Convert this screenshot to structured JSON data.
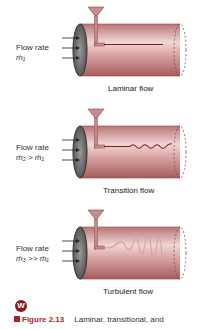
{
  "panels": [
    {
      "flow_rate_label": "Flow rate",
      "mass_flow": "ṁ₁",
      "caption": "Laminar flow",
      "regime": "laminar"
    },
    {
      "flow_rate_label": "Flow rate",
      "mass_flow": "ṁ₂ > ṁ₁",
      "caption": "Transition flow",
      "regime": "transition"
    },
    {
      "flow_rate_label": "Flow rate",
      "mass_flow": "ṁ₃ >> ṁ₁",
      "caption": "Turbulent flow",
      "regime": "turbulent"
    }
  ],
  "icon": {
    "letter": "W",
    "color": "#8b1a1a"
  },
  "figure": {
    "number": "Figure 2.13",
    "text": "Laminar, transitional, and",
    "accent": "#b01e2e"
  },
  "colors": {
    "pipe_body": "#c98a8a",
    "pipe_highlight": "#f3dede",
    "dye": "#8b1a1a",
    "pipe_end": "#555555"
  }
}
